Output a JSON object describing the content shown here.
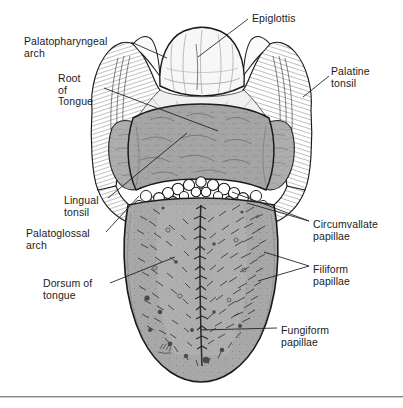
{
  "figure": {
    "domain_note": "anatomical-illustration",
    "background_color": "#ffffff",
    "ink_color": "#1b1b1b",
    "tissue_fill": "#a9a9a9",
    "tissue_fill_light": "#c4c4c4",
    "pale_fill": "#f2f2f2",
    "papillae_fill": "#fbfbfb",
    "rule_color": "#8a8a8a",
    "signature": "Mkr"
  },
  "labels": [
    {
      "id": "palatopharyngeal-arch",
      "text": "Palatopharyngeal\narch",
      "x": 24,
      "y": 36,
      "side": "left"
    },
    {
      "id": "root-of-tongue",
      "text": "Root\nof\nTongue",
      "x": 58,
      "y": 73,
      "side": "left"
    },
    {
      "id": "lingual-tonsil",
      "text": "Lingual\ntonsil",
      "x": 64,
      "y": 195,
      "side": "left"
    },
    {
      "id": "palatoglossal-arch",
      "text": "Palatoglossal\narch",
      "x": 26,
      "y": 228,
      "side": "left"
    },
    {
      "id": "dorsum-of-tongue",
      "text": "Dorsum of\ntongue",
      "x": 43,
      "y": 278,
      "side": "left"
    },
    {
      "id": "epiglottis",
      "text": "Epiglottis",
      "x": 252,
      "y": 13,
      "side": "right"
    },
    {
      "id": "palatine-tonsil",
      "text": "Palatine\ntonsil",
      "x": 331,
      "y": 66,
      "side": "right"
    },
    {
      "id": "circumvallate-papillae",
      "text": "Circumvallate\npapillae",
      "x": 313,
      "y": 219,
      "side": "right"
    },
    {
      "id": "filiform-papillae",
      "text": "Filiform\npapillae",
      "x": 313,
      "y": 264,
      "side": "right"
    },
    {
      "id": "fungiform-papillae",
      "text": "Fungiform\npapillae",
      "x": 281,
      "y": 325,
      "side": "right"
    }
  ],
  "leader_lines": [
    {
      "id": "leader-palatopharyngeal-arch",
      "x1": 131,
      "y1": 42,
      "x2": 167,
      "y2": 58
    },
    {
      "id": "leader-root-of-tongue",
      "x1": 104,
      "y1": 88,
      "x2": 218,
      "y2": 131
    },
    {
      "id": "leader-lingual-tonsil",
      "x1": 108,
      "y1": 198,
      "x2": 187,
      "y2": 133
    },
    {
      "id": "leader-palatoglossal-arch",
      "x1": 106,
      "y1": 232,
      "x2": 139,
      "y2": 196
    },
    {
      "id": "leader-dorsum-of-tongue",
      "x1": 110,
      "y1": 283,
      "x2": 175,
      "y2": 257
    },
    {
      "id": "leader-epiglottis",
      "x1": 248,
      "y1": 19,
      "x2": 198,
      "y2": 57
    },
    {
      "id": "leader-palatine-tonsil",
      "x1": 329,
      "y1": 76,
      "x2": 303,
      "y2": 97
    },
    {
      "id": "leader-circumvallate-papillae",
      "x1": 309,
      "y1": 221,
      "x2": 232,
      "y2": 192
    },
    {
      "id": "leader-filiform-papillae",
      "x1": 309,
      "y1": 266,
      "x2": 258,
      "y2": 281
    },
    {
      "id": "leader-fungiform-papillae",
      "x1": 277,
      "y1": 328,
      "x2": 200,
      "y2": 330
    }
  ],
  "structures": [
    {
      "id": "epiglottis-body",
      "name": "Epiglottis"
    },
    {
      "id": "tongue-root",
      "name": "Root of tongue"
    },
    {
      "id": "tongue-body",
      "name": "Dorsum of tongue"
    },
    {
      "id": "palatine-tonsil-left",
      "name": "Palatine tonsil (left)"
    },
    {
      "id": "palatine-tonsil-right",
      "name": "Palatine tonsil (right)"
    },
    {
      "id": "circumvallate-row",
      "name": "Circumvallate papillae (V-shaped row)"
    },
    {
      "id": "lingual-tonsil-nodules",
      "name": "Lingual tonsil"
    },
    {
      "id": "median-sulcus",
      "name": "Median sulcus"
    },
    {
      "id": "palatoglossal-arch-left",
      "name": "Palatoglossal arch (left)"
    },
    {
      "id": "palatopharyngeal-arch-left",
      "name": "Palatopharyngeal arch (left)"
    }
  ],
  "footer_rule": {
    "y": 396
  }
}
